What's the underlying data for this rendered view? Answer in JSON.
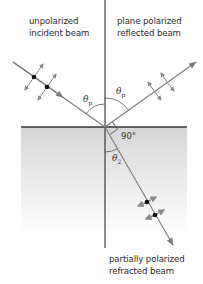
{
  "labels": {
    "incident_line1": "unpolarized",
    "incident_line2": "incident beam",
    "reflected_line1": "plane polarized",
    "reflected_line2": "reflected beam",
    "refracted_line1": "partially polarized",
    "refracted_line2": "refracted beam"
  },
  "angles": {
    "incident_symbol": "θ",
    "incident_sub": "p",
    "reflected_symbol": "θ",
    "reflected_sub": "p",
    "right_angle": "90°",
    "refracted_symbol": "θ",
    "refracted_sub": "2"
  },
  "colors": {
    "ray": "#7a7a7a",
    "normal": "#1a1a1a",
    "interface": "#333333",
    "medium_top": "#d9d9d9",
    "medium_bottom": "#ffffff",
    "dot": "#111111",
    "polarization_arrow": "#8a8a8a"
  }
}
